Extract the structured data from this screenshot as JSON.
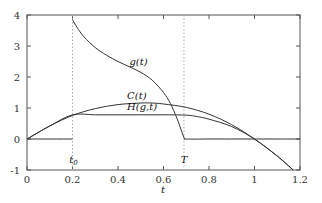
{
  "chart_data": {
    "type": "line",
    "title": "",
    "xlabel": "t",
    "ylabel": "",
    "xlim": [
      0,
      1.2
    ],
    "ylim": [
      -1,
      4
    ],
    "grid": false,
    "legend": "none (inline curve labels)",
    "x_ticks": [
      "0",
      "0.2",
      "0.4",
      "0.6",
      "0.8",
      "1",
      "1.2"
    ],
    "y_ticks": [
      "-1",
      "0",
      "1",
      "2",
      "3",
      "4"
    ],
    "annotations": [
      {
        "text": "t0",
        "x": 0.2,
        "type": "dotted-vertical-line",
        "label_y": -0.65
      },
      {
        "text": "T",
        "x": 0.69,
        "type": "dotted-vertical-line",
        "label_y": -0.65
      }
    ],
    "series": [
      {
        "name": "g(t)",
        "label_pos": [
          0.45,
          2.4
        ],
        "x": [
          0.2,
          0.22,
          0.25,
          0.3,
          0.35,
          0.4,
          0.45,
          0.5,
          0.55,
          0.6,
          0.63,
          0.66,
          0.69,
          0.7,
          0.8,
          0.9,
          1.0,
          1.1,
          1.2
        ],
        "values": [
          3.85,
          3.6,
          3.3,
          2.95,
          2.7,
          2.5,
          2.33,
          2.15,
          1.9,
          1.5,
          1.15,
          0.65,
          0.05,
          0.0,
          0.0,
          0.0,
          0.0,
          0.0,
          0.0
        ]
      },
      {
        "name": "C(t)",
        "label_pos": [
          0.44,
          1.3
        ],
        "x": [
          0.0,
          0.1,
          0.2,
          0.3,
          0.4,
          0.5,
          0.55,
          0.6,
          0.7,
          0.8,
          0.9,
          1.0,
          1.1,
          1.17
        ],
        "values": [
          0.0,
          0.42,
          0.76,
          0.98,
          1.11,
          1.16,
          1.16,
          1.13,
          1.02,
          0.8,
          0.46,
          0.0,
          -0.55,
          -1.0
        ]
      },
      {
        "name": "H(g,t)",
        "label_pos": [
          0.44,
          0.95
        ],
        "x": [
          0.0,
          0.1,
          0.2,
          0.3,
          0.4,
          0.5,
          0.6,
          0.7,
          0.75,
          0.8,
          0.9,
          1.0,
          1.1,
          1.17
        ],
        "values": [
          0.0,
          0.42,
          0.78,
          0.78,
          0.78,
          0.78,
          0.78,
          0.77,
          0.72,
          0.64,
          0.4,
          0.0,
          -0.55,
          -1.0
        ]
      },
      {
        "name": "zero-line-before-t0",
        "x": [
          0.0,
          0.2
        ],
        "values": [
          0.0,
          0.0
        ]
      }
    ],
    "colors": {
      "axes": "#555555",
      "curves": "#333333",
      "dotted": "#aaaaaa"
    }
  }
}
